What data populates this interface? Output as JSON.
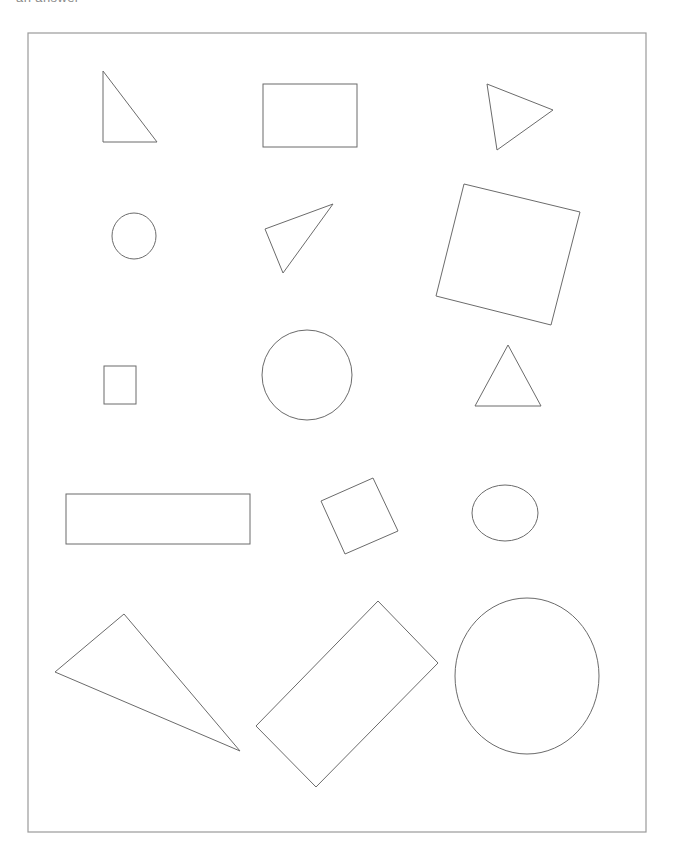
{
  "page": {
    "width": 675,
    "height": 859,
    "background_color": "#ffffff",
    "clipped_header_text": "an answer",
    "header_text_color": "#8a8a8a"
  },
  "figure": {
    "name": "geometric-shapes-worksheet",
    "stroke_color": "#6b6b6b",
    "fill_color": "none",
    "stroke_width": 1,
    "border": {
      "name": "page-border-rectangle",
      "x": 28,
      "y": 33,
      "width": 618,
      "height": 799,
      "stroke_color": "#9a9a9a",
      "stroke_width": 1.2
    },
    "shape_count": 15,
    "shape_type_counts": {
      "triangle": 5,
      "rectangle": 4,
      "square": 2,
      "circle": 3,
      "ellipse": 1
    },
    "shapes": [
      {
        "id": "shape-1",
        "label": "right-triangle-small",
        "type": "triangle",
        "row": 1,
        "column": 1,
        "points": "103,71 103,142 157,142"
      },
      {
        "id": "shape-2",
        "label": "rectangle-horizontal-medium",
        "type": "rectangle",
        "row": 1,
        "column": 2,
        "x": 263,
        "y": 84,
        "width": 94,
        "height": 63,
        "rotation": 0
      },
      {
        "id": "shape-3",
        "label": "triangle-pointing-right",
        "type": "triangle",
        "row": 1,
        "column": 3,
        "points": "487,84 553,110 497,150"
      },
      {
        "id": "shape-4",
        "label": "circle-small",
        "type": "circle",
        "row": 2,
        "column": 1,
        "cx": 134,
        "cy": 236,
        "rx": 22,
        "ry": 23
      },
      {
        "id": "shape-5",
        "label": "triangle-obtuse-tilted",
        "type": "triangle",
        "row": 2,
        "column": 2,
        "points": "265,229 333,204 283,273"
      },
      {
        "id": "shape-6",
        "label": "square-large-rotated",
        "type": "square",
        "row": 2,
        "column": 3,
        "points": "464,184 580,212 551,325 436,296"
      },
      {
        "id": "shape-7",
        "label": "rectangle-small-vertical",
        "type": "rectangle",
        "row": 3,
        "column": 1,
        "x": 104,
        "y": 366,
        "width": 32,
        "height": 38,
        "rotation": 0
      },
      {
        "id": "shape-8",
        "label": "circle-large",
        "type": "circle",
        "row": 3,
        "column": 2,
        "cx": 307,
        "cy": 375,
        "rx": 45,
        "ry": 45
      },
      {
        "id": "shape-9",
        "label": "triangle-isosceles-upright",
        "type": "triangle",
        "row": 3,
        "column": 3,
        "points": "508,345 541,406 475,406"
      },
      {
        "id": "shape-10",
        "label": "rectangle-wide-flat",
        "type": "rectangle",
        "row": 4,
        "column": 1,
        "x": 66,
        "y": 494,
        "width": 184,
        "height": 50,
        "rotation": 0
      },
      {
        "id": "shape-11",
        "label": "square-small-rotated",
        "type": "square",
        "row": 4,
        "column": 2,
        "points": "373,478 398,531 345,554 321,501"
      },
      {
        "id": "shape-12",
        "label": "ellipse-small",
        "type": "ellipse",
        "row": 4,
        "column": 3,
        "cx": 505,
        "cy": 513,
        "rx": 33,
        "ry": 28
      },
      {
        "id": "shape-13",
        "label": "triangle-large-scalene",
        "type": "triangle",
        "row": 5,
        "column": 1,
        "points": "124,614 55,672 240,751"
      },
      {
        "id": "shape-14",
        "label": "rectangle-large-rotated",
        "type": "rectangle",
        "row": 5,
        "column": 2,
        "points": "378,601 438,663 316,787 256,726"
      },
      {
        "id": "shape-15",
        "label": "ellipse-large",
        "type": "ellipse",
        "row": 5,
        "column": 3,
        "cx": 527,
        "cy": 676,
        "rx": 72,
        "ry": 78
      }
    ]
  }
}
